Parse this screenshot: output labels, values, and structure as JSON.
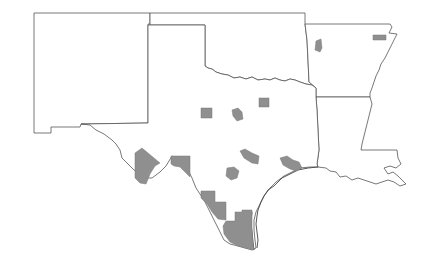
{
  "map": {
    "type": "choropleth-highlight",
    "region": "South Central United States",
    "states": [
      {
        "name": "New Mexico",
        "id": "nm"
      },
      {
        "name": "Oklahoma",
        "id": "ok"
      },
      {
        "name": "Texas",
        "id": "tx"
      },
      {
        "name": "Arkansas",
        "id": "ar"
      },
      {
        "name": "Louisiana",
        "id": "la"
      }
    ],
    "colors": {
      "background": "#ffffff",
      "state_fill": "#ffffff",
      "state_border": "#555555",
      "highlight_fill": "#8f8f8f"
    },
    "highlighted_areas": [
      {
        "state": "Arkansas",
        "position": "northwest"
      },
      {
        "state": "Arkansas",
        "position": "northeast"
      },
      {
        "state": "Texas",
        "position": "north-central west"
      },
      {
        "state": "Texas",
        "position": "north-central"
      },
      {
        "state": "Texas",
        "position": "north-central east"
      },
      {
        "state": "Texas",
        "position": "central"
      },
      {
        "state": "Texas",
        "position": "central south"
      },
      {
        "state": "Texas",
        "position": "southeast / Houston area"
      },
      {
        "state": "Texas",
        "position": "west border (Big Bend)"
      },
      {
        "state": "Texas",
        "position": "southwest border"
      },
      {
        "state": "Texas",
        "position": "south border (Laredo area)"
      },
      {
        "state": "Texas",
        "position": "south tip (Rio Grande Valley)"
      }
    ]
  }
}
